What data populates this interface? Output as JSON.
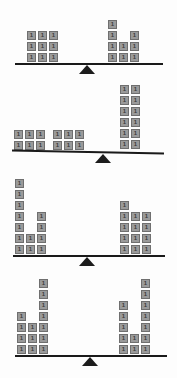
{
  "page": {
    "block_label": "1",
    "block_color": "#9a9a9a",
    "block_border_color": "#6f6f6f",
    "beam_color": "#1a1a1a",
    "fulcrum_color": "#1c1c1c",
    "background_color": "#fdfdfd"
  },
  "chart_data": {
    "type": "bar",
    "xlabel": "",
    "ylabel": "number of unit blocks",
    "categories": [
      "scale-1",
      "scale-2",
      "scale-3",
      "scale-4"
    ],
    "series": [
      {
        "name": "left pan total",
        "values": [
          9,
          12,
          13,
          14
        ]
      },
      {
        "name": "right pan total",
        "values": [
          9,
          12,
          13,
          14
        ]
      }
    ],
    "legend_position": "none",
    "grid": false
  },
  "scales": [
    {
      "id": "scale-1",
      "tilt_deg": 0,
      "left": {
        "name": "left-pan",
        "total": 9,
        "columns": [
          3,
          3,
          3
        ]
      },
      "right": {
        "name": "right-pan",
        "total": 9,
        "columns": [
          4,
          2,
          3
        ]
      }
    },
    {
      "id": "scale-2",
      "tilt_deg": 1.2,
      "left": {
        "name": "left-pan",
        "total": 12,
        "columns": [
          2,
          2,
          2,
          2,
          2,
          2
        ]
      },
      "right": {
        "name": "right-pan",
        "total": 12,
        "columns": [
          6,
          6
        ]
      }
    },
    {
      "id": "scale-3",
      "tilt_deg": 0,
      "left": {
        "name": "left-pan",
        "total": 13,
        "columns": [
          7,
          2,
          4
        ]
      },
      "right": {
        "name": "right-pan",
        "total": 13,
        "columns": [
          5,
          4,
          4
        ]
      }
    },
    {
      "id": "scale-4",
      "tilt_deg": 0,
      "left": {
        "name": "left-pan",
        "total": 14,
        "columns": [
          4,
          3,
          7
        ]
      },
      "right": {
        "name": "right-pan",
        "total": 14,
        "columns": [
          5,
          2,
          7
        ]
      }
    }
  ]
}
